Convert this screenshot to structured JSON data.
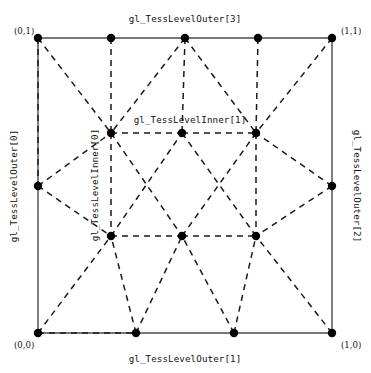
{
  "figure": {
    "type": "tessellation-diagram",
    "colors": {
      "background": "#ffffff",
      "outline": "#4a4a4a",
      "inner_edge": "#1a1a1a",
      "vertex": "#000000",
      "text": "#111111"
    }
  },
  "corners": {
    "top_left": "(0,1)",
    "top_right": "(1,1)",
    "bottom_left": "(0,0)",
    "bottom_right": "(1,0)"
  },
  "labels": {
    "outer_top": "gl_TessLevelOuter[3]",
    "outer_bottom": "gl_TessLevelOuter[1]",
    "outer_left": "gl_TessLevelOuter[0]",
    "outer_right": "gl_TessLevelOuter[2]",
    "inner_horizontal": "gl_TessLevelInner[1]",
    "inner_vertical": "gl_TessLevelInner[0]"
  },
  "chart_data": {
    "type": "scatter",
    "xlabel": "gl_TessLevelOuter[1]",
    "ylabel": "gl_TessLevelOuter[0]",
    "xlim": [
      0,
      1
    ],
    "ylim": [
      0,
      1
    ],
    "grid": false,
    "legend": "none",
    "outer_subdivisions": {
      "outer0_left": 2,
      "outer1_bottom": 3,
      "outer2_right": 2,
      "outer3_top": 4
    },
    "inner_subdivisions": {
      "inner0_vertical": 2,
      "inner1_horizontal": 3
    },
    "vertices": [
      {
        "id": "c-bl",
        "x": 38,
        "y": 333,
        "ring": "outer",
        "label": "(0,0)"
      },
      {
        "id": "c-tl",
        "x": 38,
        "y": 38,
        "ring": "outer",
        "label": "(0,1)"
      },
      {
        "id": "c-tr",
        "x": 332,
        "y": 38,
        "ring": "outer",
        "label": "(1,1)"
      },
      {
        "id": "c-br",
        "x": 332,
        "y": 333,
        "ring": "outer",
        "label": "(1,0)"
      },
      {
        "id": "t1",
        "x": 111,
        "y": 38,
        "ring": "outer",
        "label": ""
      },
      {
        "id": "t2",
        "x": 185,
        "y": 38,
        "ring": "outer",
        "label": ""
      },
      {
        "id": "t3",
        "x": 258,
        "y": 38,
        "ring": "outer",
        "label": ""
      },
      {
        "id": "b1",
        "x": 136,
        "y": 333,
        "ring": "outer",
        "label": ""
      },
      {
        "id": "b2",
        "x": 234,
        "y": 333,
        "ring": "outer",
        "label": ""
      },
      {
        "id": "l1",
        "x": 38,
        "y": 186,
        "ring": "outer",
        "label": ""
      },
      {
        "id": "r1",
        "x": 332,
        "y": 186,
        "ring": "outer",
        "label": ""
      },
      {
        "id": "i-tl",
        "x": 111,
        "y": 133,
        "ring": "inner",
        "label": ""
      },
      {
        "id": "i-tm",
        "x": 182,
        "y": 133,
        "ring": "inner",
        "label": ""
      },
      {
        "id": "i-tr",
        "x": 256,
        "y": 133,
        "ring": "inner",
        "label": ""
      },
      {
        "id": "i-bl",
        "x": 111,
        "y": 236,
        "ring": "inner",
        "label": ""
      },
      {
        "id": "i-bm",
        "x": 182,
        "y": 236,
        "ring": "inner",
        "label": ""
      },
      {
        "id": "i-br",
        "x": 256,
        "y": 236,
        "ring": "inner",
        "label": ""
      }
    ],
    "outline_edges": [
      [
        "c-tl",
        "t1"
      ],
      [
        "t1",
        "t2"
      ],
      [
        "t2",
        "t3"
      ],
      [
        "t3",
        "c-tr"
      ],
      [
        "c-bl",
        "b1"
      ],
      [
        "b1",
        "b2"
      ],
      [
        "b2",
        "c-br"
      ],
      [
        "c-tl",
        "l1"
      ],
      [
        "l1",
        "c-bl"
      ],
      [
        "c-tr",
        "r1"
      ],
      [
        "r1",
        "c-br"
      ]
    ],
    "inner_ring_edges": [
      [
        "i-tl",
        "i-tm"
      ],
      [
        "i-tm",
        "i-tr"
      ],
      [
        "i-bl",
        "i-bm"
      ],
      [
        "i-bm",
        "i-br"
      ],
      [
        "i-tl",
        "i-bl"
      ],
      [
        "i-tr",
        "i-br"
      ]
    ],
    "triangulation_edges": [
      [
        "c-tl",
        "i-tl"
      ],
      [
        "t1",
        "i-tl"
      ],
      [
        "t2",
        "i-tl"
      ],
      [
        "t2",
        "i-tm"
      ],
      [
        "t2",
        "i-tr"
      ],
      [
        "t3",
        "i-tr"
      ],
      [
        "c-tr",
        "i-tr"
      ],
      [
        "c-tl",
        "l1"
      ],
      [
        "l1",
        "i-tl"
      ],
      [
        "l1",
        "i-bl"
      ],
      [
        "c-bl",
        "i-bl"
      ],
      [
        "c-bl",
        "b1"
      ],
      [
        "b1",
        "i-bl"
      ],
      [
        "b1",
        "i-bm"
      ],
      [
        "b2",
        "i-bm"
      ],
      [
        "b2",
        "i-br"
      ],
      [
        "c-br",
        "i-br"
      ],
      [
        "r1",
        "i-br"
      ],
      [
        "r1",
        "i-tr"
      ],
      [
        "i-tl",
        "i-bm"
      ],
      [
        "i-tm",
        "i-br"
      ],
      [
        "i-bl",
        "i-tm"
      ],
      [
        "i-bm",
        "i-tr"
      ]
    ]
  }
}
